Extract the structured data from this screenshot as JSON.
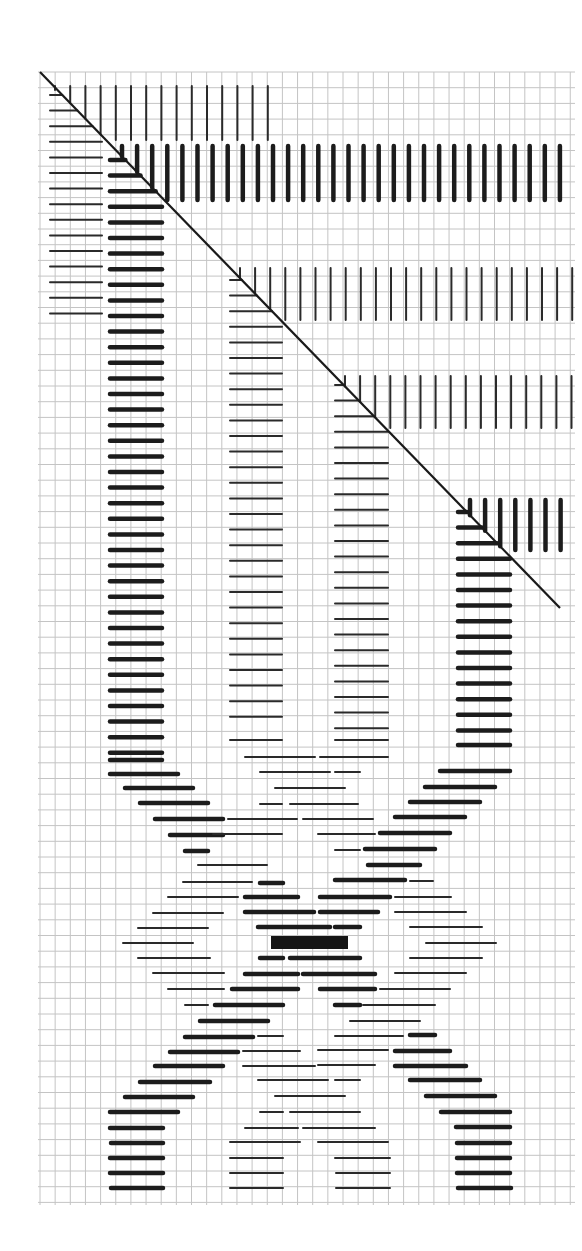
{
  "diagram": {
    "colors": {
      "paper": "#ffffff",
      "grid": "#c4c4c4",
      "ink": "#1c1c1c"
    },
    "grid": {
      "x0": 40,
      "x1": 570,
      "y0": 72,
      "y1": 1205,
      "dx": 15.15,
      "dy": 15.7
    },
    "diagonal": {
      "x1": 40,
      "y1": 72,
      "x2": 560,
      "y2": 608
    },
    "vertical_bands": [
      {
        "name": "band-1-thin",
        "weight": "thin",
        "x_start": 55,
        "x_end": 268,
        "y_top": 86,
        "y_bottom": 140,
        "step": 15.2
      },
      {
        "name": "band-2-thick",
        "weight": "thick",
        "x_start": 122,
        "x_end": 572,
        "y_top": 146,
        "y_bottom": 200,
        "step": 15.1
      },
      {
        "name": "band-3-thin",
        "weight": "thin",
        "x_start": 240,
        "x_end": 575,
        "y_top": 268,
        "y_bottom": 320,
        "step": 15.1
      },
      {
        "name": "band-4-thin",
        "weight": "thin",
        "x_start": 345,
        "x_end": 575,
        "y_top": 376,
        "y_bottom": 428,
        "step": 15.1
      },
      {
        "name": "band-5-thick",
        "weight": "thick",
        "x_start": 470,
        "x_end": 572,
        "y_top": 500,
        "y_bottom": 550,
        "step": 15.1
      }
    ],
    "horizontal_columns": [
      {
        "name": "column-a-thin",
        "weight": "thin",
        "x1": 50,
        "x2": 102,
        "y_top": 95,
        "y_bottom": 313,
        "step": 15.6
      },
      {
        "name": "column-b-thick",
        "weight": "thick",
        "x1": 110,
        "x2": 162,
        "y_top": 160,
        "y_bottom": 760,
        "step": 15.6
      },
      {
        "name": "column-c-thin",
        "weight": "thin",
        "x1": 230,
        "x2": 282,
        "y_top": 280,
        "y_bottom": 730,
        "step": 15.6
      },
      {
        "name": "column-d-thin",
        "weight": "thin",
        "x1": 335,
        "x2": 388,
        "y_top": 385,
        "y_bottom": 730,
        "step": 15.6
      },
      {
        "name": "column-e-thick",
        "weight": "thick",
        "x1": 458,
        "x2": 510,
        "y_top": 512,
        "y_bottom": 745,
        "step": 15.6
      }
    ],
    "braid_stitches": [
      [
        "thick",
        110,
        162,
        760
      ],
      [
        "thin",
        230,
        282,
        740
      ],
      [
        "thin",
        335,
        388,
        740
      ],
      [
        "thick",
        458,
        510,
        745
      ],
      [
        "thick",
        110,
        178,
        774
      ],
      [
        "thin",
        245,
        315,
        757
      ],
      [
        "thin",
        320,
        388,
        757
      ],
      [
        "thick",
        440,
        510,
        771
      ],
      [
        "thick",
        125,
        193,
        788
      ],
      [
        "thin",
        260,
        330,
        772
      ],
      [
        "thin",
        335,
        360,
        772
      ],
      [
        "thick",
        425,
        495,
        787
      ],
      [
        "thick",
        140,
        208,
        803
      ],
      [
        "thin",
        275,
        345,
        788
      ],
      [
        "thick",
        410,
        480,
        802
      ],
      [
        "thick",
        155,
        223,
        819
      ],
      [
        "thin",
        260,
        282,
        804
      ],
      [
        "thin",
        290,
        358,
        804
      ],
      [
        "thick",
        395,
        465,
        817
      ],
      [
        "thick",
        170,
        223,
        835
      ],
      [
        "thin",
        228,
        297,
        819
      ],
      [
        "thin",
        303,
        373,
        819
      ],
      [
        "thick",
        380,
        450,
        833
      ],
      [
        "thick",
        185,
        208,
        851
      ],
      [
        "thin",
        213,
        282,
        834
      ],
      [
        "thin",
        318,
        375,
        834
      ],
      [
        "thick",
        365,
        435,
        849
      ],
      [
        "thin",
        198,
        267,
        865
      ],
      [
        "thin",
        335,
        360,
        850
      ],
      [
        "thick",
        368,
        420,
        865
      ],
      [
        "thin",
        183,
        252,
        882
      ],
      [
        "thick",
        260,
        283,
        883
      ],
      [
        "thick",
        335,
        405,
        880
      ],
      [
        "thin",
        410,
        433,
        881
      ],
      [
        "thin",
        168,
        238,
        897
      ],
      [
        "thick",
        245,
        298,
        897
      ],
      [
        "thick",
        320,
        390,
        897
      ],
      [
        "thin",
        395,
        451,
        897
      ],
      [
        "thin",
        153,
        223,
        913
      ],
      [
        "thick",
        245,
        314,
        912
      ],
      [
        "thick",
        320,
        378,
        912
      ],
      [
        "thin",
        395,
        466,
        912
      ],
      [
        "thin",
        138,
        208,
        928
      ],
      [
        "thick",
        258,
        330,
        927
      ],
      [
        "thick",
        335,
        360,
        927
      ],
      [
        "thin",
        410,
        482,
        927
      ],
      [
        "thin",
        123,
        193,
        943
      ],
      [
        "thin",
        426,
        496,
        943
      ],
      [
        "thin",
        138,
        210,
        958
      ],
      [
        "thick",
        260,
        283,
        958
      ],
      [
        "thick",
        290,
        360,
        958
      ],
      [
        "thin",
        410,
        482,
        958
      ],
      [
        "thin",
        153,
        224,
        973
      ],
      [
        "thick",
        245,
        298,
        974
      ],
      [
        "thick",
        303,
        375,
        974
      ],
      [
        "thin",
        395,
        466,
        973
      ],
      [
        "thin",
        168,
        224,
        989
      ],
      [
        "thick",
        232,
        298,
        989
      ],
      [
        "thick",
        320,
        375,
        989
      ],
      [
        "thin",
        380,
        450,
        989
      ],
      [
        "thin",
        185,
        208,
        1005
      ],
      [
        "thick",
        215,
        283,
        1005
      ],
      [
        "thick",
        335,
        360,
        1005
      ],
      [
        "thin",
        363,
        435,
        1005
      ],
      [
        "thick",
        200,
        268,
        1021
      ],
      [
        "thin",
        350,
        420,
        1021
      ],
      [
        "thick",
        185,
        253,
        1037
      ],
      [
        "thin",
        258,
        283,
        1036
      ],
      [
        "thin",
        335,
        403,
        1036
      ],
      [
        "thick",
        410,
        435,
        1035
      ],
      [
        "thick",
        170,
        238,
        1052
      ],
      [
        "thin",
        243,
        300,
        1051
      ],
      [
        "thin",
        318,
        388,
        1050
      ],
      [
        "thick",
        395,
        450,
        1051
      ],
      [
        "thick",
        155,
        223,
        1066
      ],
      [
        "thin",
        243,
        315,
        1066
      ],
      [
        "thin",
        318,
        375,
        1065
      ],
      [
        "thick",
        395,
        466,
        1066
      ],
      [
        "thick",
        140,
        210,
        1082
      ],
      [
        "thin",
        258,
        328,
        1080
      ],
      [
        "thin",
        335,
        360,
        1080
      ],
      [
        "thick",
        410,
        480,
        1080
      ],
      [
        "thick",
        125,
        193,
        1097
      ],
      [
        "thin",
        275,
        345,
        1096
      ],
      [
        "thick",
        426,
        495,
        1096
      ],
      [
        "thick",
        110,
        178,
        1112
      ],
      [
        "thin",
        260,
        283,
        1112
      ],
      [
        "thin",
        290,
        360,
        1112
      ],
      [
        "thick",
        441,
        510,
        1112
      ],
      [
        "thick",
        110,
        163,
        1128
      ],
      [
        "thin",
        245,
        298,
        1128
      ],
      [
        "thin",
        303,
        375,
        1128
      ],
      [
        "thick",
        456,
        510,
        1127
      ],
      [
        "thick",
        111,
        163,
        1143
      ],
      [
        "thin",
        230,
        300,
        1142
      ],
      [
        "thin",
        318,
        388,
        1142
      ],
      [
        "thick",
        457,
        510,
        1143
      ],
      [
        "thick",
        110,
        163,
        1158
      ],
      [
        "thin",
        230,
        283,
        1158
      ],
      [
        "thin",
        335,
        390,
        1158
      ],
      [
        "thick",
        457,
        510,
        1158
      ],
      [
        "thick",
        110,
        163,
        1173
      ],
      [
        "thin",
        230,
        283,
        1173
      ],
      [
        "thin",
        336,
        390,
        1173
      ],
      [
        "thick",
        457,
        510,
        1173
      ],
      [
        "thick",
        111,
        163,
        1188
      ],
      [
        "thin",
        230,
        283,
        1188
      ],
      [
        "thin",
        336,
        390,
        1188
      ],
      [
        "thick",
        458,
        511,
        1188
      ]
    ],
    "center_block": {
      "x": 271,
      "y": 936,
      "width": 77,
      "height": 13
    }
  }
}
